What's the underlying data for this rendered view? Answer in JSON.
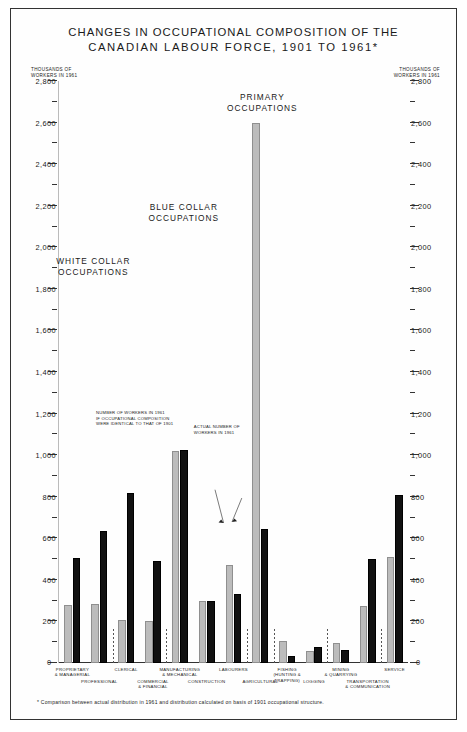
{
  "title": {
    "line1": "CHANGES IN OCCUPATIONAL COMPOSITION OF THE",
    "line2": "CANADIAN LABOUR FORCE, 1901 TO 1961*"
  },
  "axis_caption": {
    "line1": "THOUSANDS OF",
    "line2": "WORKERS IN 1961"
  },
  "zero_label": "0",
  "footnote": "* Comparison between actual distribution in 1961 and distribution calculated on basis of 1901 occupational structure.",
  "sections": [
    {
      "id": "white-collar",
      "line1": "WHITE COLLAR",
      "line2": "OCCUPATIONS"
    },
    {
      "id": "blue-collar",
      "line1": "BLUE COLLAR",
      "line2": "OCCUPATIONS"
    },
    {
      "id": "primary",
      "line1": "PRIMARY",
      "line2": "OCCUPATIONS"
    }
  ],
  "callouts": [
    {
      "id": "estimated",
      "line1": "NUMBER OF WORKERS IN 1961",
      "line2": "IF OCCUPATIONAL COMPOSITION",
      "line3": "WERE IDENTICAL TO THAT OF 1901"
    },
    {
      "id": "actual",
      "line1": "ACTUAL NUMBER OF",
      "line2": "WORKERS IN 1961",
      "line3": ""
    }
  ],
  "chart_data": {
    "type": "bar",
    "title": "CHANGES IN OCCUPATIONAL COMPOSITION OF THE CANADIAN LABOUR FORCE, 1901 TO 1961*",
    "xlabel": "",
    "ylabel": "THOUSANDS OF WORKERS IN 1961",
    "ylim": [
      0,
      2800
    ],
    "ytick_major_step": 200,
    "ytick_minor_step": 100,
    "grid": false,
    "legend_position": "inline-callouts",
    "ytick_labels": [
      "0",
      "200",
      "400",
      "600",
      "800",
      "1,000",
      "1,200",
      "1,400",
      "1,600",
      "1,800",
      "2,000",
      "2,200",
      "2,400",
      "2,600",
      "2,800"
    ],
    "categories": [
      "PROPRIETARY & MANAGERIAL",
      "PROFESSIONAL",
      "CLERICAL",
      "COMMERCIAL & FINANCIAL",
      "MANUFACTURING & MECHANICAL",
      "CONSTRUCTION",
      "LABOURERS",
      "AGRICULTURAL",
      "FISHING (HUNTING & TRAPPING)",
      "LOGGING",
      "MINING & QUARRYING",
      "TRANSPORTATION & COMMUNICATION",
      "SERVICE"
    ],
    "series": [
      {
        "name": "NUMBER OF WORKERS IN 1961 IF OCCUPATIONAL COMPOSITION WERE IDENTICAL TO THAT OF 1901",
        "color": "#bcbcbc",
        "values": [
          280,
          285,
          205,
          200,
          1020,
          300,
          470,
          2600,
          105,
          60,
          95,
          275,
          510
        ]
      },
      {
        "name": "ACTUAL NUMBER OF WORKERS IN 1961",
        "color": "#111111",
        "values": [
          505,
          635,
          820,
          490,
          1025,
          300,
          330,
          645,
          35,
          75,
          65,
          500,
          810
        ]
      }
    ],
    "group_dividers_after": [
      1,
      3,
      6,
      7,
      9,
      11
    ]
  }
}
